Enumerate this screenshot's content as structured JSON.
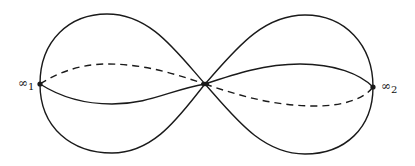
{
  "diagram": {
    "labels": {
      "left_point": {
        "base": "∞",
        "sub": "1"
      },
      "right_point": {
        "base": "∞",
        "sub": "2"
      }
    },
    "points": {
      "left": [
        40,
        84
      ],
      "center": [
        205,
        84
      ],
      "right": [
        373,
        87
      ]
    },
    "stroke_color": "#1a1a1a"
  }
}
